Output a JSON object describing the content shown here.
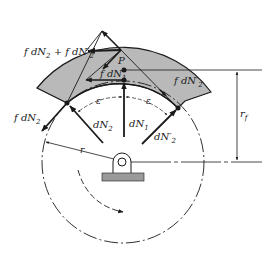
{
  "diagram": {
    "colors": {
      "shoe_fill": "#b9b9b9",
      "base_fill": "#9a9a9a",
      "line": "#1a1a1a",
      "background": "#ffffff"
    },
    "labels": {
      "friction_sum": {
        "pre": "f dN",
        "sub1": "2",
        "mid": " + f dN′",
        "sub2": "2"
      },
      "f_dN1": {
        "pre": "f dN",
        "sub": "1"
      },
      "P": "P",
      "f_dN2_prime": {
        "pre": "f dN′",
        "sub": "2"
      },
      "f_dN2": {
        "pre": "f dN",
        "sub": "2"
      },
      "dN2": {
        "pre": "dN",
        "sub": "2"
      },
      "dN1": {
        "pre": "dN",
        "sub": "1"
      },
      "dN2_prime": {
        "pre": "dN′",
        "sub": "2"
      },
      "epsilon_left": "ε",
      "epsilon_right": "ε",
      "r": "r",
      "r_f": {
        "pre": "r",
        "sub": "f"
      }
    }
  }
}
